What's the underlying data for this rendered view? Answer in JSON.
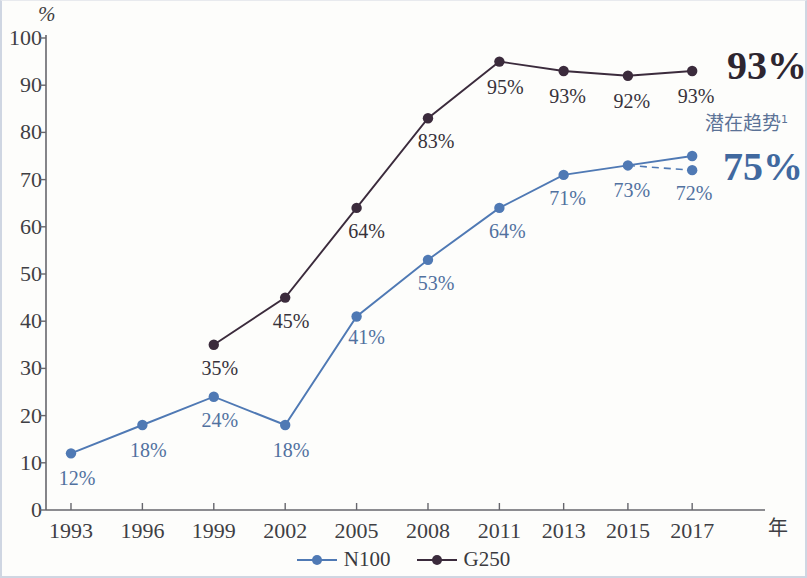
{
  "chart_data": {
    "type": "line",
    "title": "",
    "xlabel": "年",
    "ylabel": "%",
    "ylim": [
      0,
      100
    ],
    "ytick_step": 10,
    "yticks": [
      "0",
      "10",
      "20",
      "30",
      "40",
      "50",
      "60",
      "70",
      "80",
      "90",
      "100"
    ],
    "categories": [
      "1993",
      "1996",
      "1999",
      "2002",
      "2005",
      "2008",
      "2011",
      "2013",
      "2015",
      "2017"
    ],
    "grid": false,
    "legend_position": "bottom-center",
    "series": [
      {
        "name": "N100",
        "color": "#4f79b4",
        "values": [
          12,
          18,
          24,
          18,
          41,
          53,
          64,
          71,
          73,
          75
        ],
        "labels": [
          "12%",
          "18%",
          "24%",
          "18%",
          "41%",
          "53%",
          "64%",
          "71%",
          "73%",
          ""
        ],
        "projection": {
          "label": "72%",
          "value": 72,
          "from_category": "2015",
          "to_category": "2017",
          "style": "dashed"
        }
      },
      {
        "name": "G250",
        "color": "#3b2b3c",
        "values": [
          null,
          null,
          35,
          45,
          64,
          83,
          95,
          93,
          92,
          93
        ],
        "labels": [
          "",
          "",
          "35%",
          "45%",
          "64%",
          "83%",
          "95%",
          "93%",
          "92%",
          "93%"
        ]
      }
    ],
    "annotations": [
      {
        "text": "93%",
        "kind": "end-value",
        "series": "G250"
      },
      {
        "text": "75%",
        "kind": "end-value",
        "series": "N100"
      },
      {
        "text": "潜在趋势",
        "superscript": "1",
        "kind": "trend-note"
      }
    ]
  },
  "axis": {
    "y_unit": "%",
    "x_unit": "年"
  },
  "legend": {
    "items": [
      {
        "label": "N100",
        "color": "#4f79b4"
      },
      {
        "label": "G250",
        "color": "#3b2b3c"
      }
    ]
  },
  "callouts": {
    "g250_big": "93%",
    "n100_big": "75%",
    "trend_text": "潜在趋势",
    "trend_superscript": "1"
  }
}
